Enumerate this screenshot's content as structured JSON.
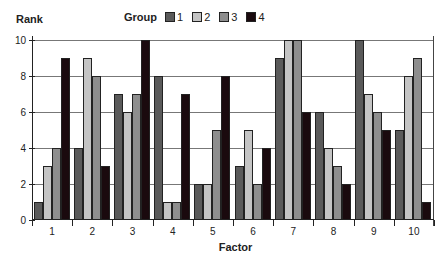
{
  "chart_data": {
    "type": "bar",
    "title": "",
    "xlabel": "Factor",
    "ylabel": "Rank",
    "ylim": [
      0,
      10
    ],
    "yticks": [
      0,
      2,
      4,
      6,
      8,
      10
    ],
    "grid": true,
    "legend_title": "Group",
    "legend_position": "top",
    "categories": [
      "1",
      "2",
      "3",
      "4",
      "5",
      "6",
      "7",
      "8",
      "9",
      "10"
    ],
    "series": [
      {
        "name": "1",
        "color": "#5a5a5a",
        "values": [
          1,
          4,
          7,
          8,
          2,
          3,
          9,
          6,
          10,
          5
        ]
      },
      {
        "name": "2",
        "color": "#c4c4c4",
        "values": [
          3,
          9,
          6,
          1,
          2,
          5,
          10,
          4,
          7,
          8
        ]
      },
      {
        "name": "3",
        "color": "#8e8e8e",
        "values": [
          4,
          8,
          7,
          1,
          5,
          2,
          10,
          3,
          6,
          9
        ]
      },
      {
        "name": "4",
        "color": "#1a0a0e",
        "values": [
          9,
          3,
          10,
          7,
          8,
          4,
          6,
          2,
          5,
          1
        ]
      }
    ]
  }
}
